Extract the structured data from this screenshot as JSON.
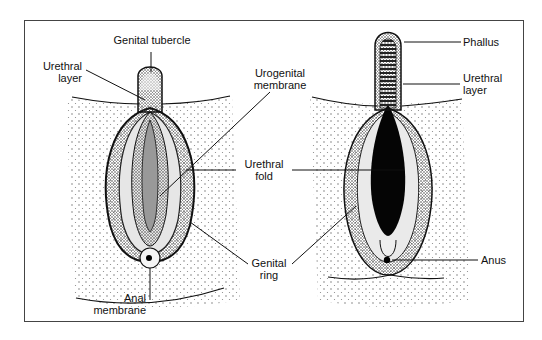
{
  "figure": {
    "left_panel": {
      "name": "undifferentiated external genitalia",
      "labels": {
        "genital_tubercle": "Genital tubercle",
        "urethral_layer_1": "Urethral",
        "urethral_layer_2": "layer",
        "urogenital_membrane_1": "Urogenital",
        "urogenital_membrane_2": "membrane",
        "anal_membrane_1": "Anal",
        "anal_membrane_2": "membrane"
      }
    },
    "right_panel": {
      "name": "differentiating male external genitalia",
      "labels": {
        "phallus": "Phallus",
        "urethral_layer_1": "Urethral",
        "urethral_layer_2": "layer",
        "anus": "Anus"
      }
    },
    "shared_labels": {
      "urethral_fold_1": "Urethral",
      "urethral_fold_2": "fold",
      "genital_ring_1": "Genital",
      "genital_ring_2": "ring"
    },
    "colors": {
      "ink": "#111111",
      "frame": "#444444",
      "background": "#ffffff"
    }
  }
}
